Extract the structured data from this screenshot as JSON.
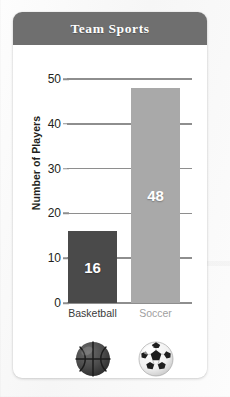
{
  "card": {
    "title": "Team Sports"
  },
  "chart_data": {
    "type": "bar",
    "title": "Team Sports",
    "xlabel": "",
    "ylabel": "Number of Players",
    "categories": [
      "Basketball",
      "Soccer"
    ],
    "values": [
      16,
      48
    ],
    "value_labels": [
      "16",
      "48"
    ],
    "ylim": [
      0,
      50
    ],
    "yticks": [
      0,
      10,
      20,
      30,
      40,
      50
    ],
    "ytick_labels": [
      "0",
      "10",
      "20",
      "30",
      "40",
      "50"
    ],
    "grid": true,
    "legend": "none",
    "series": [
      {
        "name": "Number of Players",
        "values": [
          16,
          48
        ]
      }
    ],
    "bar_colors": [
      "#4a4a4a",
      "#a9a9a9"
    ],
    "colors": {
      "header_bar": "#6f6f6f",
      "card_background": "#ffffff",
      "gridline": "#8e8e8e",
      "axis_text": "#231f20",
      "basketball_bar": "#4a4a4a",
      "soccer_bar": "#a9a9a9",
      "value_label_text": "#ffffff",
      "basketball_label_text": "#3a3a3a",
      "soccer_label_text": "#a0a0a0"
    },
    "category_label_colors": [
      "#3a3a3a",
      "#a0a0a0"
    ],
    "icons": [
      "basketball-icon",
      "soccer-ball-icon"
    ]
  }
}
